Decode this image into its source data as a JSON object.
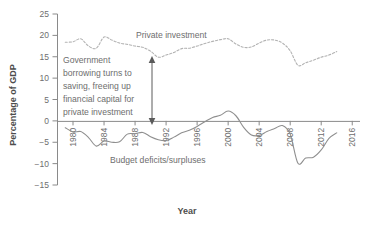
{
  "chart_data": {
    "type": "line",
    "title": "",
    "xlabel": "Year",
    "ylabel": "Percentage of GDP",
    "xlim": [
      1978,
      2017
    ],
    "ylim": [
      -15,
      25
    ],
    "grid": false,
    "legend": "inline-labels",
    "x_ticks": [
      1980,
      1984,
      1988,
      1992,
      1996,
      2000,
      2004,
      2008,
      2012,
      2016
    ],
    "x_tick_labels": [
      "1980",
      "1984",
      "1988",
      "1992",
      "1996",
      "2000",
      "2004",
      "2008",
      "2012",
      "2016"
    ],
    "y_ticks": [
      -15,
      -10,
      -5,
      0,
      5,
      10,
      15,
      20,
      25
    ],
    "y_tick_labels": [
      "−15",
      "−10",
      "−5",
      "0",
      "5",
      "10",
      "15",
      "20",
      "25"
    ],
    "series": [
      {
        "name": "Private investment",
        "style": "dashed",
        "label_text": "Private investment",
        "x": [
          1979,
          1980,
          1981,
          1982,
          1983,
          1984,
          1985,
          1986,
          1987,
          1988,
          1989,
          1990,
          1991,
          1992,
          1993,
          1994,
          1995,
          1996,
          1997,
          1998,
          1999,
          2000,
          2001,
          2002,
          2003,
          2004,
          2005,
          2006,
          2007,
          2008,
          2009,
          2010,
          2011,
          2012,
          2013,
          2014
        ],
        "values": [
          18.4,
          18.5,
          19.2,
          17.5,
          17.0,
          19.6,
          18.9,
          18.2,
          17.9,
          17.5,
          17.2,
          16.3,
          14.9,
          15.4,
          16.0,
          16.9,
          17.0,
          17.5,
          18.1,
          18.6,
          19.0,
          19.2,
          18.0,
          17.2,
          17.3,
          18.2,
          18.9,
          18.9,
          18.2,
          16.4,
          13.0,
          13.6,
          14.2,
          14.9,
          15.4,
          16.2
        ]
      },
      {
        "name": "Budget deficits/surpluses",
        "style": "solid",
        "label_text": "Budget deficits/surpluses",
        "x": [
          1979,
          1980,
          1981,
          1982,
          1983,
          1984,
          1985,
          1986,
          1987,
          1988,
          1989,
          1990,
          1991,
          1992,
          1993,
          1994,
          1995,
          1996,
          1997,
          1998,
          1999,
          2000,
          2001,
          2002,
          2003,
          2004,
          2005,
          2006,
          2007,
          2008,
          2009,
          2010,
          2011,
          2012,
          2013,
          2014
        ],
        "values": [
          -1.6,
          -2.6,
          -2.5,
          -3.9,
          -5.9,
          -4.7,
          -5.0,
          -4.9,
          -3.1,
          -3.0,
          -2.7,
          -3.7,
          -4.4,
          -4.6,
          -3.8,
          -2.8,
          -2.2,
          -1.3,
          -0.2,
          0.8,
          1.3,
          2.3,
          1.2,
          -1.5,
          -3.3,
          -3.4,
          -2.5,
          -1.8,
          -1.1,
          -3.1,
          -9.9,
          -8.7,
          -8.5,
          -6.8,
          -4.1,
          -2.8
        ]
      }
    ],
    "annotations": [
      {
        "id": "annotation-note",
        "lines": [
          "Government",
          "borrowing turns to",
          "saving, freeing up",
          "financial capital for",
          "private investment"
        ]
      },
      {
        "id": "double-arrow",
        "kind": "double-headed-arrow"
      }
    ],
    "colors": {
      "axis": "#8a8a8a",
      "text": "#6e6e6e",
      "title": "#4d4d4d",
      "solid_series": "#8f8f8f",
      "dashed_series": "#b3b3b3",
      "background": "#ffffff"
    }
  }
}
